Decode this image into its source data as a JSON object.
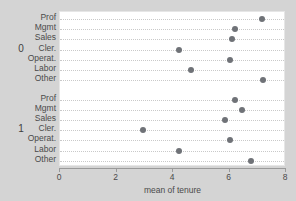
{
  "chart_data": {
    "type": "scatter",
    "title": "",
    "subtitle": "",
    "xlabel": "mean of tenure",
    "ylabel": "",
    "xlim": [
      0,
      8
    ],
    "xticks": [
      0,
      2,
      4,
      6,
      8
    ],
    "xtick_labels": [
      "0",
      "2",
      "4",
      "6",
      "8"
    ],
    "grid": "horizontal-dotted-per-row",
    "legend": "none",
    "orientation": "horizontal-dot-plot",
    "marker_color": "#6f7277",
    "panel_background": "#ffffff",
    "figure_background": "#d4d4d4",
    "grid_color": "#c9c9c9",
    "axis_color": "#9a9a9a",
    "groups": [
      {
        "group_label": "0",
        "categories": [
          "Prof",
          "Mgmt",
          "Sales",
          "Cler.",
          "Operat.",
          "Labor",
          "Other"
        ],
        "values": [
          7.15,
          6.2,
          6.1,
          4.2,
          6.0,
          4.65,
          7.2
        ]
      },
      {
        "group_label": "1",
        "categories": [
          "Prof",
          "Mgmt",
          "Sales",
          "Cler.",
          "Operat.",
          "Labor",
          "Other"
        ],
        "values": [
          6.2,
          6.45,
          5.85,
          2.95,
          6.0,
          4.2,
          6.75
        ]
      }
    ]
  },
  "axis": {
    "x_title": "mean of tenure"
  }
}
